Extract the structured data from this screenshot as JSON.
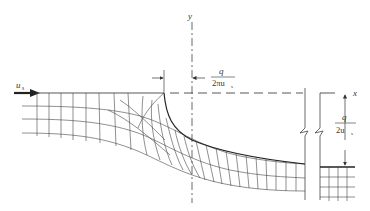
{
  "diagram": {
    "type": "flow-net",
    "colors": {
      "ink": "#333333",
      "mesh": "#444444",
      "background": "#ffffff"
    },
    "labels": {
      "inflow_velocity": {
        "main": "u",
        "sub": "s"
      },
      "y_axis": "y",
      "x_axis": "x",
      "offset_dimension": {
        "numerator": "q",
        "denominator_main": "2πu",
        "denominator_sub": "s"
      },
      "jet_thickness_dimension": {
        "numerator": "q",
        "denominator_main": "2u",
        "denominator_sub": "s"
      }
    },
    "features": [
      "inflow-arrow",
      "wall-line",
      "dashed-x-axis",
      "dash-dot-y-axis",
      "free-streamline",
      "break-marks",
      "flow-net-mesh",
      "downstream-jet-mesh"
    ]
  }
}
